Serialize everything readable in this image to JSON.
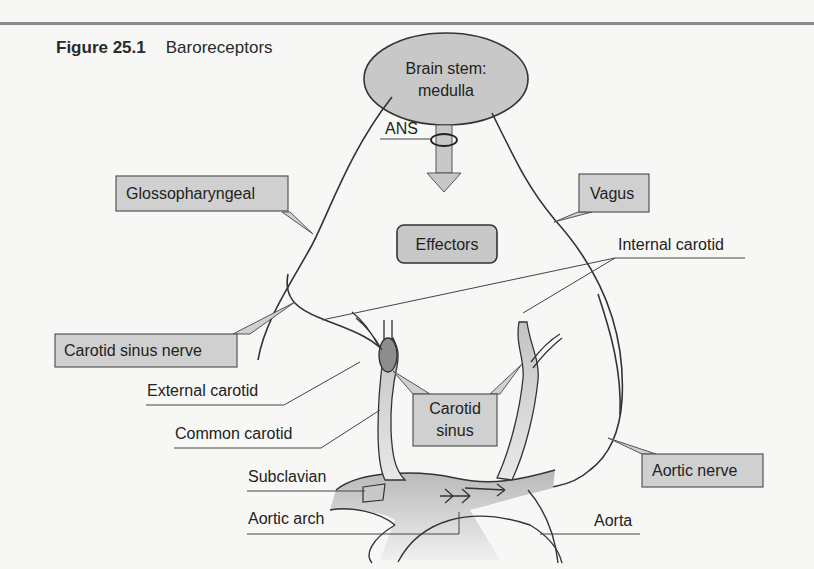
{
  "figure": {
    "number": "Figure 25.1",
    "title": "Baroreceptors"
  },
  "nodes": {
    "brain_stem_line1": "Brain stem:",
    "brain_stem_line2": "medulla",
    "ans": "ANS",
    "effectors": "Effectors"
  },
  "callouts": {
    "glossopharyngeal": "Glossopharyngeal",
    "vagus": "Vagus",
    "carotid_sinus_nerve": "Carotid sinus nerve",
    "carotid_sinus_line1": "Carotid",
    "carotid_sinus_line2": "sinus",
    "aortic_nerve": "Aortic nerve"
  },
  "labels": {
    "internal_carotid": "Internal carotid",
    "external_carotid": "External carotid",
    "common_carotid": "Common carotid",
    "subclavian": "Subclavian",
    "aortic_arch": "Aortic arch",
    "aorta": "Aorta"
  },
  "colors": {
    "fill_gray": "#c8c8c8",
    "stroke": "#333333",
    "rule": "#8a8a8a"
  }
}
